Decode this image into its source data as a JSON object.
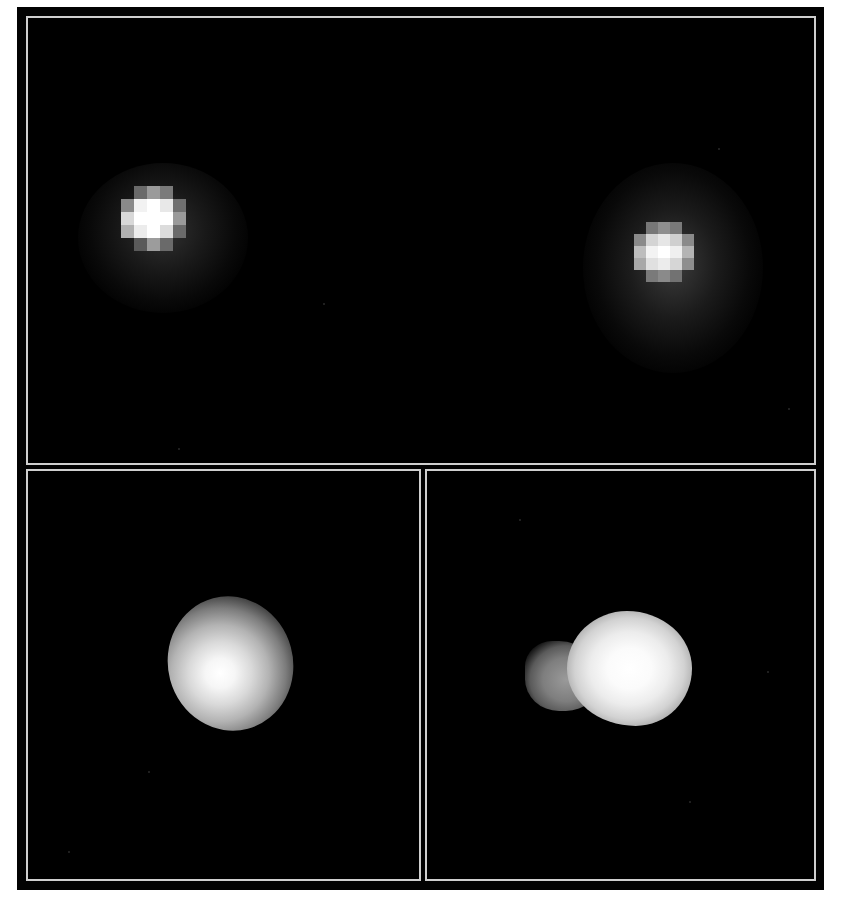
{
  "image": {
    "description": "Composite astronomical image: three black panels framed by thin light-gray borders showing point-like and extended light sources",
    "background_color": "#000000",
    "border_color": "#cfcfcf",
    "panels": [
      {
        "id": "top",
        "label": "",
        "content": "two pixelated point sources (stars) with diffuse halos",
        "sources": [
          {
            "name": "left-star",
            "center": [
              158,
              225
            ],
            "pixel_block": 13,
            "core_color": "#ffffff"
          },
          {
            "name": "right-star",
            "center": [
              668,
              262
            ],
            "pixel_block": 12,
            "core_color": "#f4f4f4"
          }
        ]
      },
      {
        "id": "bottom-left",
        "label": "",
        "content": "single smooth elongated blob, brightest toward lower-left",
        "sources": [
          {
            "name": "round-blob",
            "center": [
              228,
              665
            ]
          }
        ]
      },
      {
        "id": "bottom-right",
        "label": "",
        "content": "bright blob with a fainter lobe/tail extending to the left",
        "sources": [
          {
            "name": "lobed-blob",
            "center": [
              612,
              668
            ]
          }
        ]
      }
    ]
  }
}
